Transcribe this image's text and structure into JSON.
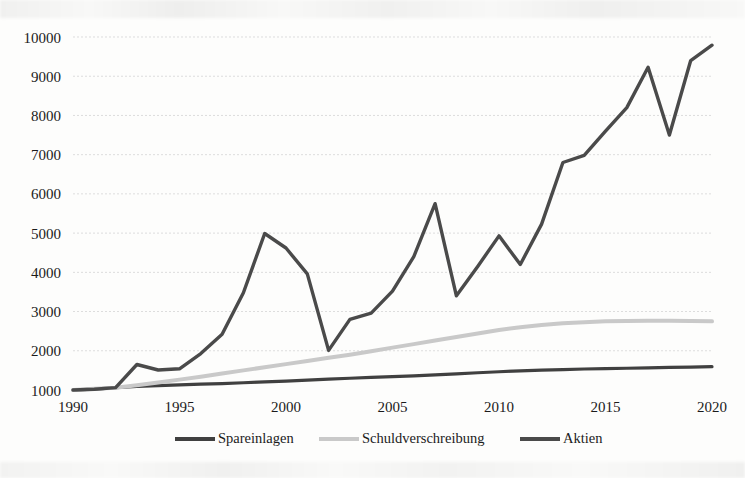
{
  "chart_data": {
    "type": "line",
    "title": "",
    "subtitle": "",
    "xlabel": "",
    "ylabel": "",
    "x": [
      1990,
      1991,
      1992,
      1993,
      1994,
      1995,
      1996,
      1997,
      1998,
      1999,
      2000,
      2001,
      2002,
      2003,
      2004,
      2005,
      2006,
      2007,
      2008,
      2009,
      2010,
      2011,
      2012,
      2013,
      2014,
      2015,
      2016,
      2017,
      2018,
      2019,
      2020
    ],
    "xlim": [
      1990,
      2020
    ],
    "ylim": [
      1000,
      10000
    ],
    "y_ticks": [
      1000,
      2000,
      3000,
      4000,
      5000,
      6000,
      7000,
      8000,
      9000,
      10000
    ],
    "y_tick_labels": [
      "1000",
      "2000",
      "3000",
      "4000",
      "5000",
      "6000",
      "7000",
      "8000",
      "9000",
      "10000"
    ],
    "x_ticks": [
      1990,
      1995,
      2000,
      2005,
      2010,
      2015,
      2020
    ],
    "x_tick_labels": [
      "1990",
      "1995",
      "2000",
      "2005",
      "2010",
      "2015",
      "2020"
    ],
    "grid": true,
    "grid_axis": "y",
    "grid_color": "#d9d9d9",
    "legend_position": "bottom",
    "series": [
      {
        "name": "Spareinlagen",
        "color": "#404040",
        "width": 3.2,
        "values": [
          1000,
          1020,
          1060,
          1090,
          1110,
          1130,
          1150,
          1165,
          1185,
          1205,
          1225,
          1250,
          1275,
          1300,
          1320,
          1340,
          1360,
          1385,
          1410,
          1440,
          1465,
          1490,
          1505,
          1520,
          1535,
          1545,
          1555,
          1565,
          1575,
          1585,
          1595
        ]
      },
      {
        "name": "Schuldverschreibung",
        "color": "#c9c9c9",
        "width": 4.0,
        "values": [
          1000,
          1030,
          1060,
          1120,
          1190,
          1265,
          1340,
          1420,
          1500,
          1580,
          1660,
          1740,
          1820,
          1900,
          1990,
          2080,
          2170,
          2260,
          2350,
          2440,
          2530,
          2600,
          2655,
          2700,
          2730,
          2750,
          2760,
          2765,
          2765,
          2760,
          2750
        ]
      },
      {
        "name": "Aktien",
        "color": "#4a4a4a",
        "width": 3.4,
        "values": [
          1000,
          1020,
          1060,
          1650,
          1510,
          1540,
          1930,
          2420,
          3480,
          4990,
          4620,
          3960,
          2010,
          2800,
          2960,
          3520,
          4400,
          5750,
          3400,
          4150,
          4930,
          4200,
          5230,
          6800,
          6980,
          7600,
          8200,
          9230,
          7500,
          9400,
          9790
        ]
      }
    ]
  },
  "legend": {
    "items": [
      {
        "label": "Spareinlagen",
        "color": "#404040"
      },
      {
        "label": "Schuldverschreibung",
        "color": "#c9c9c9"
      },
      {
        "label": "Aktien",
        "color": "#4a4a4a"
      }
    ]
  },
  "axes": {
    "y_axis_name": "value-axis",
    "x_axis_name": "year-axis"
  }
}
